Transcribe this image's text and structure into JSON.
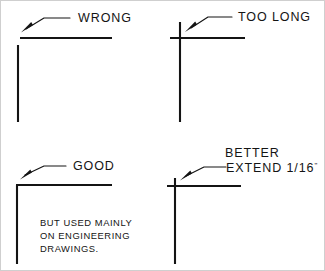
{
  "figure": {
    "type": "technical-drafting-instruction-diagram",
    "ink_color": "#141414",
    "background_color": "#ffffff"
  },
  "panels": [
    {
      "id": "wrong",
      "label": "WRONG",
      "defect": "gap-between-lines",
      "corner": {
        "vertical_x": 18,
        "vertical_top": 45,
        "vertical_bottom": 122,
        "horizontal_y": 38,
        "horizontal_left": 20,
        "horizontal_right": 112
      },
      "leader": {
        "arrow_x": 22,
        "arrow_y": 31,
        "elbow_x": 44,
        "elbow_y": 18,
        "end_x": 70,
        "end_y": 18
      },
      "label_x": 78,
      "label_y": 22
    },
    {
      "id": "too-long",
      "label": "TOO LONG",
      "defect": "vertical-overshoot-excessive",
      "corner": {
        "vertical_x": 180,
        "vertical_top": 22,
        "vertical_bottom": 122,
        "horizontal_y": 38,
        "horizontal_left": 170,
        "horizontal_right": 245
      },
      "leader": {
        "arrow_x": 186,
        "arrow_y": 31,
        "elbow_x": 208,
        "elbow_y": 17,
        "end_x": 232,
        "end_y": 17
      },
      "label_x": 238,
      "label_y": 21
    },
    {
      "id": "good",
      "label": "GOOD",
      "defect": "none",
      "corner": {
        "vertical_x": 17,
        "vertical_top": 185,
        "vertical_bottom": 264,
        "horizontal_y": 185,
        "horizontal_left": 17,
        "horizontal_right": 112
      },
      "leader": {
        "arrow_x": 21,
        "arrow_y": 178,
        "elbow_x": 44,
        "elbow_y": 166,
        "end_x": 66,
        "end_y": 166
      },
      "label_x": 73,
      "label_y": 170,
      "note_lines": [
        "BUT USED MAINLY",
        "ON ENGINEERING",
        "DRAWINGS."
      ],
      "note_x": 40,
      "note_y": 226,
      "note_line_height": 13
    },
    {
      "id": "better",
      "label_line_1": "BETTER",
      "label_line_2_prefix": "EXTEND 1/16",
      "label_line_2_unit": "\"",
      "defect": "slight-intentional-overshoot",
      "overshoot": "1/16\"",
      "corner": {
        "vertical_x": 175,
        "vertical_top": 178,
        "vertical_bottom": 264,
        "horizontal_y": 186,
        "horizontal_left": 167,
        "horizontal_right": 241
      },
      "leader": {
        "arrow_x": 181,
        "arrow_y": 179,
        "elbow_x": 204,
        "elbow_y": 167,
        "end_x": 226,
        "end_y": 167
      },
      "label_1_x": 225,
      "label_1_y": 157,
      "label_2_x": 226,
      "label_2_y": 172
    }
  ]
}
